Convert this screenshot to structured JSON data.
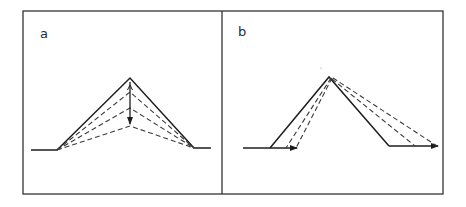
{
  "figure": {
    "panels": [
      {
        "id": "a",
        "label": "a",
        "description": "Symmetric ridge profile with vertical lowering of apex; dashed profiles show successive lowered ridge crests",
        "baseline_left": [
          [
            31,
            150
          ],
          [
            57,
            150
          ]
        ],
        "baseline_right": [
          [
            194,
            148
          ],
          [
            211,
            148
          ]
        ],
        "apex": [
          130,
          78
        ],
        "dashed_apexes": [
          [
            130,
            92
          ],
          [
            130,
            108
          ],
          [
            130,
            126
          ]
        ],
        "vertical_arrow": {
          "from": [
            130,
            80
          ],
          "to": [
            130,
            125
          ]
        }
      },
      {
        "id": "b",
        "label": "b",
        "description": "Ridge profile with lateral retreat of slopes; dashed lines show parallel slope retreat with arrows along baseline",
        "baseline_left": [
          [
            243,
            148
          ],
          [
            298,
            148
          ]
        ],
        "left_foot": [
          270,
          148
        ],
        "apex": [
          329,
          77
        ],
        "right_foot": [
          389,
          146
        ],
        "baseline_right": [
          [
            389,
            146
          ],
          [
            439,
            146
          ]
        ],
        "dashed_left_feet": [
          [
            286,
            148
          ],
          [
            296,
            148
          ]
        ],
        "dashed_right_feet": [
          [
            415,
            146
          ],
          [
            437,
            146
          ]
        ],
        "arrows": [
          {
            "from": [
              270,
              148
            ],
            "to": [
              298,
              148
            ]
          },
          {
            "from": [
              389,
              146
            ],
            "to": [
              439,
              146
            ]
          }
        ]
      }
    ],
    "frame": {
      "x": 23,
      "y": 11,
      "width": 420,
      "height": 183,
      "divider_x": 222
    }
  }
}
